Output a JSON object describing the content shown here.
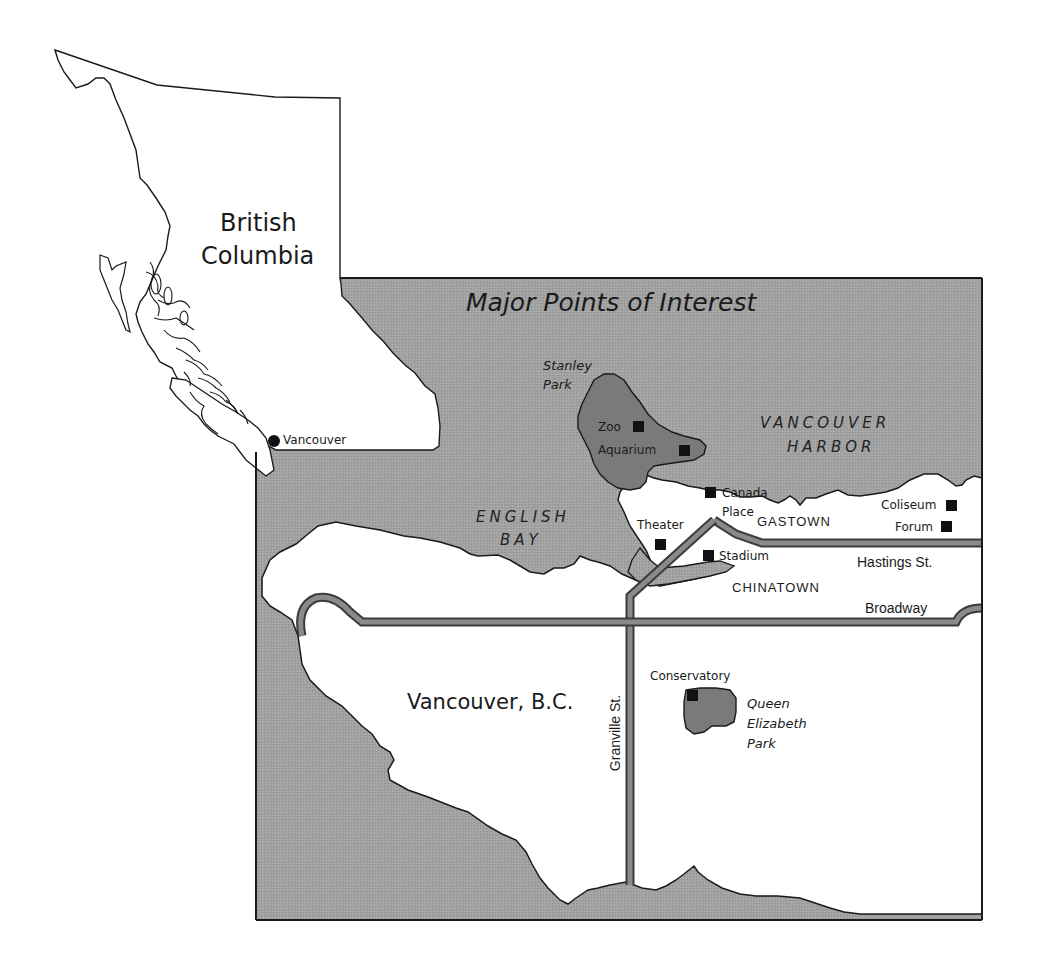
{
  "colors": {
    "water": "#9e9e9e",
    "park": "#7d7d7d",
    "land": "#ffffff",
    "road_fill": "#8a8a8a",
    "road_edge": "#3c3c3c",
    "outline": "#1a1a1a"
  },
  "overview": {
    "region_label_line1": "British",
    "region_label_line2": "Columbia",
    "city_marker": "Vancouver"
  },
  "inset": {
    "title": "Major Points of Interest",
    "city_label": "Vancouver, B.C.",
    "water_bodies": [
      {
        "line1": "VANCOUVER",
        "line2": "HARBOR"
      },
      {
        "line1": "ENGLISH",
        "line2": "BAY"
      }
    ],
    "parks": [
      {
        "line1": "Stanley",
        "line2": "Park"
      },
      {
        "line1": "Queen",
        "line2": "Elizabeth",
        "line3": "Park"
      }
    ],
    "neighborhoods": [
      "GASTOWN",
      "CHINATOWN"
    ],
    "streets": [
      "Hastings St.",
      "Broadway",
      "Granville St."
    ],
    "points_of_interest": [
      {
        "name": "Zoo"
      },
      {
        "name": "Aquarium"
      },
      {
        "name": "Canada",
        "name2": "Place"
      },
      {
        "name": "Theater"
      },
      {
        "name": "Stadium"
      },
      {
        "name": "Coliseum"
      },
      {
        "name": "Forum"
      },
      {
        "name": "Conservatory"
      }
    ]
  }
}
